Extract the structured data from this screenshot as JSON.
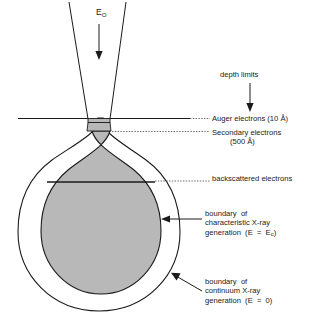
{
  "diagram": {
    "beam": {
      "energy_label": "E",
      "energy_subscript": "O"
    },
    "annotations": {
      "depth_limits": "depth limits",
      "auger": "Auger electrons (10 Å)",
      "secondary_line1": "Secondary electrons",
      "secondary_line2": "(500 Å)",
      "backscattered": "backscattered electrons",
      "characteristic_line1": "boundary  of",
      "characteristic_line2": "characteristic X-ray",
      "characteristic_line3a": "generation  (E  =  E",
      "characteristic_sub": "c",
      "characteristic_line3b": ")",
      "continuum_line1": "boundary  of",
      "continuum_line2": "continuum X-ray",
      "continuum_line3": "generation  (E  =  0)"
    },
    "colors": {
      "stroke": "#1a1a1a",
      "interaction_fill": "#b8b8b8",
      "background": "#ffffff",
      "leader": "#555555"
    }
  }
}
